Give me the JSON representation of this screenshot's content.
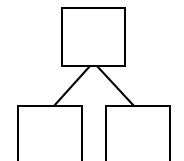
{
  "diagram": {
    "type": "tree",
    "stroke_color": "#000000",
    "background": "#ffffff",
    "nodes": [
      {
        "id": "root",
        "label": ""
      },
      {
        "id": "left-child",
        "label": ""
      },
      {
        "id": "right-child",
        "label": ""
      }
    ],
    "edges": [
      {
        "from": "root",
        "to": "left-child"
      },
      {
        "from": "root",
        "to": "right-child"
      }
    ]
  }
}
